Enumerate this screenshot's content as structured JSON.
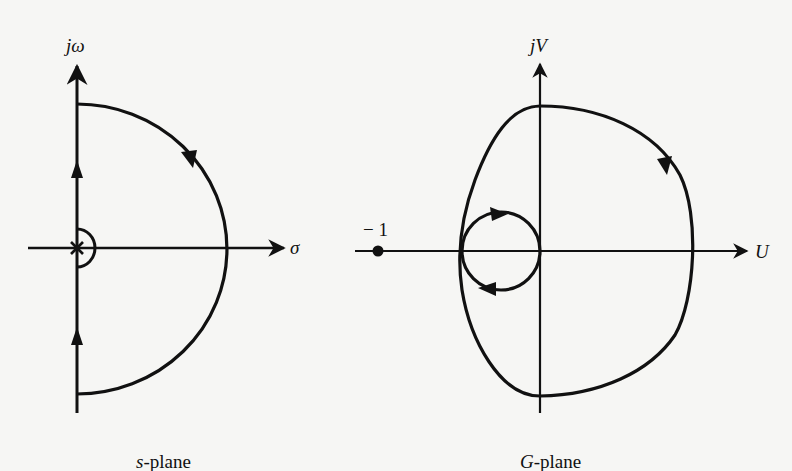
{
  "left_panel": {
    "caption_italic": "s",
    "caption_rest": "-plane",
    "vertical_axis_label": "jω",
    "horizontal_axis_label": "σ",
    "pole_marker": "×"
  },
  "right_panel": {
    "caption_italic": "G",
    "caption_rest": "-plane",
    "vertical_axis_label": "jV",
    "horizontal_axis_label": "U",
    "critical_point_label": "− 1"
  },
  "colors": {
    "stroke": "#111111",
    "background": "#f6f6f4"
  }
}
